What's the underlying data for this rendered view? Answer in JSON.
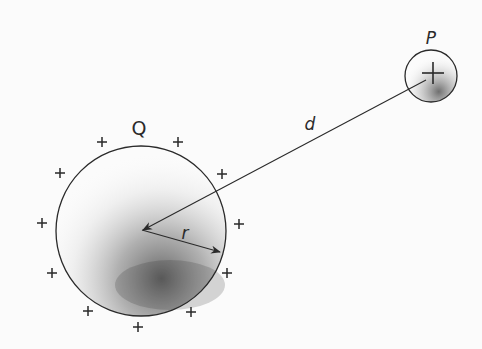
{
  "diagram": {
    "labels": {
      "sphere": "Q",
      "point_charge": "P",
      "distance": "d",
      "radius": "r"
    },
    "sphere": {
      "cx": 141,
      "cy": 231,
      "r": 85,
      "charge_sign": "+",
      "surface_charges": 11
    },
    "point_charge": {
      "cx": 431,
      "cy": 76,
      "r": 26,
      "sign": "+"
    },
    "plus_positions": [
      [
        102,
        142
      ],
      [
        178,
        142
      ],
      [
        60,
        173
      ],
      [
        222,
        174
      ],
      [
        42,
        223
      ],
      [
        239,
        224
      ],
      [
        52,
        273
      ],
      [
        227,
        273
      ],
      [
        88,
        311
      ],
      [
        191,
        312
      ],
      [
        138,
        327
      ]
    ],
    "colors": {
      "stroke": "#2a2a2a",
      "background": "#fbfbfb",
      "shading": "#333333"
    }
  }
}
